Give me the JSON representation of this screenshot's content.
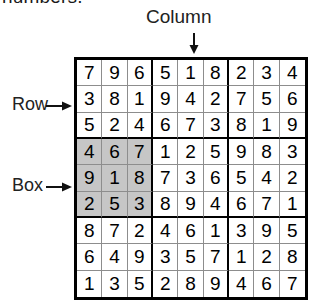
{
  "top_caption": "numbers.",
  "labels": {
    "column": "Column",
    "row": "Row",
    "box": "Box"
  },
  "icons": {
    "column_arrow": "arrow-down-icon",
    "row_arrow": "arrow-right-icon",
    "box_arrow": "arrow-right-icon"
  },
  "colors": {
    "grid_border": "#000000",
    "cell_border": "#8d8d8d",
    "shaded_box": "#c6c6c6",
    "cell_background": "#ffffff",
    "text": "#000000"
  },
  "grid": {
    "size": 9,
    "rows": [
      [
        7,
        9,
        6,
        5,
        1,
        8,
        2,
        3,
        4
      ],
      [
        3,
        8,
        1,
        9,
        4,
        2,
        7,
        5,
        6
      ],
      [
        5,
        2,
        4,
        6,
        7,
        3,
        8,
        1,
        9
      ],
      [
        4,
        6,
        7,
        1,
        2,
        5,
        9,
        8,
        3
      ],
      [
        9,
        1,
        8,
        7,
        3,
        6,
        5,
        4,
        2
      ],
      [
        2,
        5,
        3,
        8,
        9,
        4,
        6,
        7,
        1
      ],
      [
        8,
        7,
        2,
        4,
        6,
        1,
        3,
        9,
        5
      ],
      [
        6,
        4,
        9,
        3,
        5,
        7,
        1,
        2,
        8
      ],
      [
        1,
        3,
        5,
        2,
        8,
        9,
        4,
        6,
        7
      ]
    ],
    "shaded_cells": [
      [
        4,
        1
      ],
      [
        4,
        2
      ],
      [
        4,
        3
      ],
      [
        5,
        1
      ],
      [
        5,
        2
      ],
      [
        5,
        3
      ],
      [
        6,
        1
      ],
      [
        6,
        2
      ],
      [
        6,
        3
      ]
    ],
    "highlighted_column": 5,
    "highlighted_row": 2,
    "highlighted_box_row": 5
  }
}
